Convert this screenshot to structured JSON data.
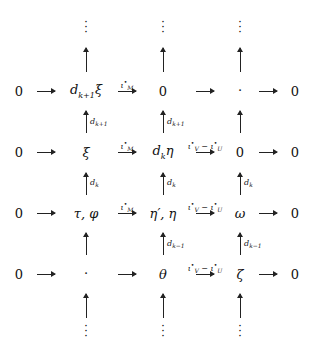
{
  "diagram": {
    "rows": [
      {
        "left": "0",
        "c1": "d_{k+1}ξ",
        "a1": "ι*_M",
        "c2": "0",
        "a2": "",
        "c3": "·",
        "right": "0"
      },
      {
        "left": "0",
        "c1": "ξ",
        "a1": "ι*_M",
        "c2": "d_k η",
        "a2": "ι*_V − ι*_U",
        "c3": "0",
        "right": "0"
      },
      {
        "left": "0",
        "c1": "τ, φ",
        "a1": "ι*_M",
        "c2": "η′, η",
        "a2": "ι*_V − ι*_U",
        "c3": "ω",
        "right": "0"
      },
      {
        "left": "0",
        "c1": "·",
        "a1": "",
        "c2": "θ",
        "a2": "ι*_V − ι*_U",
        "c3": "ζ",
        "right": "0"
      }
    ],
    "vertical_labels": {
      "row0_to_1": {
        "c1": "d_{k+1}",
        "c2": "d_{k+1}",
        "c3": ""
      },
      "row1_to_2": {
        "c1": "d_k",
        "c2": "d_k",
        "c3": "d_k"
      },
      "row2_to_3": {
        "c1": "",
        "c2": "d_{k−1}",
        "c3": "d_{k−1}"
      }
    },
    "labels": {
      "zero": "0",
      "dot": "·",
      "vdots": "⋮",
      "r0c1": "d",
      "r0c1sub": "k+1",
      "r0c1tail": "ξ",
      "xi": "ξ",
      "dk_d": "d",
      "dk_sub": "k",
      "eta": "η",
      "tauphi": "τ, φ",
      "etapeta": "η′, η",
      "omega": "ω",
      "theta": "θ",
      "zeta": "ζ",
      "iM": "ι",
      "iM_sub": "M",
      "iV": "ι",
      "iV_sub": "V",
      "minus": " − ",
      "iU": "ι",
      "iU_sub": "U",
      "star": "•",
      "dkp1": "d",
      "kp1": "k+1",
      "dk": "d",
      "k": "k",
      "dkm1": "d",
      "km1": "k−1"
    }
  }
}
